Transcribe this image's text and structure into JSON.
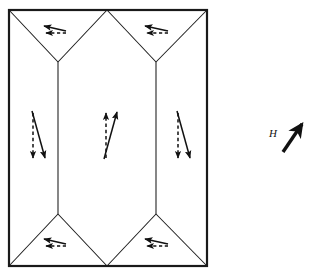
{
  "figure": {
    "name": "magnetic-domain-structure-diagram",
    "background_color": "#ffffff",
    "line_color": "#1a1a1a",
    "arrow_color": "#111111",
    "specimen": {
      "outline_name": "specimen-outline-rectangle",
      "left": 9,
      "top": 10,
      "right": 207,
      "bottom": 266,
      "stroke_width": 2.2
    },
    "domain_walls": {
      "vertical_wall_left_x": 58,
      "vertical_wall_right_x": 156,
      "top_center_vertex_x": 107,
      "bottom_center_vertex_x": 107,
      "upper_wall_y": 62,
      "lower_wall_y": 214,
      "stroke_width": 1.0
    },
    "arrow_groups": [
      {
        "name": "arrow-pair-top-left-closure-domain",
        "region": "top-left closure domain",
        "solid_direction": "left",
        "dashed_direction": "left",
        "solid_label": "magnetization",
        "dashed_label": "reference"
      },
      {
        "name": "arrow-pair-top-right-closure-domain",
        "region": "top-right closure domain",
        "solid_direction": "left",
        "dashed_direction": "left",
        "solid_label": "magnetization",
        "dashed_label": "reference"
      },
      {
        "name": "arrow-pair-left-domain",
        "region": "left main domain",
        "solid_direction": "down",
        "dashed_direction": "down",
        "solid_label": "magnetization",
        "dashed_label": "reference"
      },
      {
        "name": "arrow-pair-center-domain",
        "region": "center main domain",
        "solid_direction": "up",
        "dashed_direction": "up",
        "solid_label": "magnetization",
        "dashed_label": "reference"
      },
      {
        "name": "arrow-pair-right-domain",
        "region": "right main domain",
        "solid_direction": "down",
        "dashed_direction": "down",
        "solid_label": "magnetization",
        "dashed_label": "reference"
      },
      {
        "name": "arrow-pair-bottom-left-closure-domain",
        "region": "bottom-left closure domain",
        "solid_direction": "left",
        "dashed_direction": "left",
        "solid_label": "magnetization",
        "dashed_label": "reference"
      },
      {
        "name": "arrow-pair-bottom-right-closure-domain",
        "region": "bottom-right closure domain",
        "solid_direction": "left",
        "dashed_direction": "left",
        "solid_label": "magnetization",
        "dashed_label": "reference"
      }
    ],
    "applied_field": {
      "label": "H",
      "label_x": 273,
      "label_y": 137,
      "arrow_direction": "up-right",
      "arrow_tail_x": 283,
      "arrow_tail_y": 152,
      "arrow_tip_x": 302,
      "arrow_tip_y": 124,
      "arrow_style": "bold-solid"
    }
  }
}
